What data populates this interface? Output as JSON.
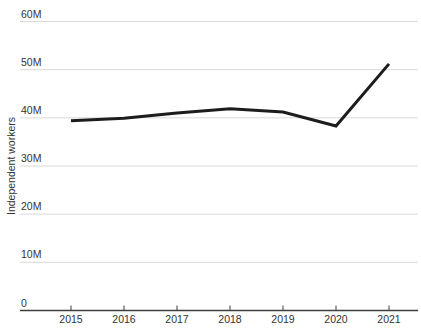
{
  "chart_data": {
    "type": "line",
    "title": "",
    "ylabel": "Independent workers",
    "xlabel": "",
    "categories": [
      "2015",
      "2016",
      "2017",
      "2018",
      "2019",
      "2020",
      "2021"
    ],
    "series": [
      {
        "name": "Independent workers",
        "values_millions": [
          39.3,
          39.8,
          40.9,
          41.8,
          41.1,
          38.2,
          51.1
        ]
      }
    ],
    "unit": "millions of workers",
    "y_ticks": [
      {
        "value": 0,
        "label": "0"
      },
      {
        "value": 10,
        "label": "10M"
      },
      {
        "value": 20,
        "label": "20M"
      },
      {
        "value": 30,
        "label": "30M"
      },
      {
        "value": 40,
        "label": "40M"
      },
      {
        "value": 50,
        "label": "50M"
      },
      {
        "value": 60,
        "label": "60M"
      }
    ],
    "ylim": [
      0,
      60
    ],
    "grid": "horizontal-only",
    "legend": "none",
    "colors": {
      "line": "#1d1d1d",
      "gridline": "#d9d9d9",
      "axis": "#3f3f3f",
      "text": "#333333",
      "background": "#ffffff"
    }
  }
}
